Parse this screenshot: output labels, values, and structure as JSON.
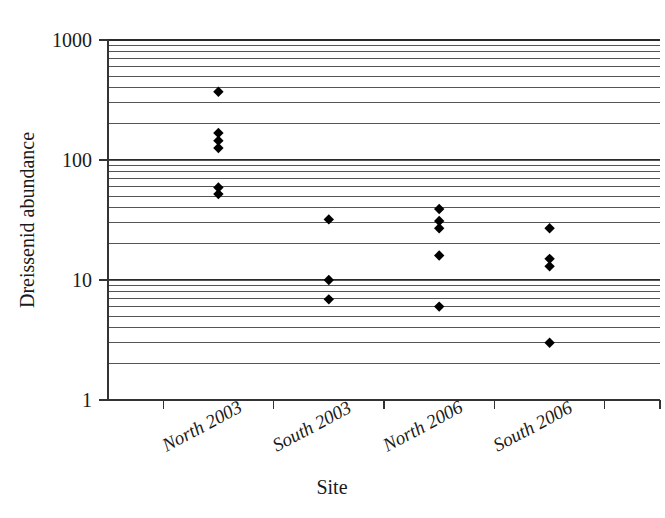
{
  "figure": {
    "background_color": "#ffffff",
    "marker_color": "#000000",
    "gridline_color": "#555555",
    "axis_color": "#333333"
  },
  "chart_data": {
    "type": "scatter",
    "title": "",
    "xlabel": "Site",
    "ylabel": "Dreissenid abundance",
    "yscale": "log",
    "ylim": [
      1,
      1000
    ],
    "grid": "horizontal-minor-and-major",
    "legend": "none",
    "y_tick_labels": [
      "1000",
      "100",
      "10",
      "1"
    ],
    "y_tick_values": [
      1000,
      100,
      10,
      1
    ],
    "categories": [
      "North 2003",
      "South 2003",
      "North 2006",
      "South 2006"
    ],
    "series": [
      {
        "name": "Dreissenid abundance",
        "points": [
          {
            "category": "North 2003",
            "value": 370
          },
          {
            "category": "North 2003",
            "value": 168
          },
          {
            "category": "North 2003",
            "value": 145
          },
          {
            "category": "North 2003",
            "value": 126
          },
          {
            "category": "North 2003",
            "value": 59
          },
          {
            "category": "North 2003",
            "value": 52
          },
          {
            "category": "South 2003",
            "value": 32
          },
          {
            "category": "South 2003",
            "value": 10
          },
          {
            "category": "South 2003",
            "value": 6.9
          },
          {
            "category": "North 2006",
            "value": 39
          },
          {
            "category": "North 2006",
            "value": 31
          },
          {
            "category": "North 2006",
            "value": 27
          },
          {
            "category": "North 2006",
            "value": 16
          },
          {
            "category": "North 2006",
            "value": 6.0
          },
          {
            "category": "South 2006",
            "value": 27
          },
          {
            "category": "South 2006",
            "value": 15
          },
          {
            "category": "South 2006",
            "value": 13
          },
          {
            "category": "South 2006",
            "value": 3.0
          }
        ]
      }
    ]
  }
}
